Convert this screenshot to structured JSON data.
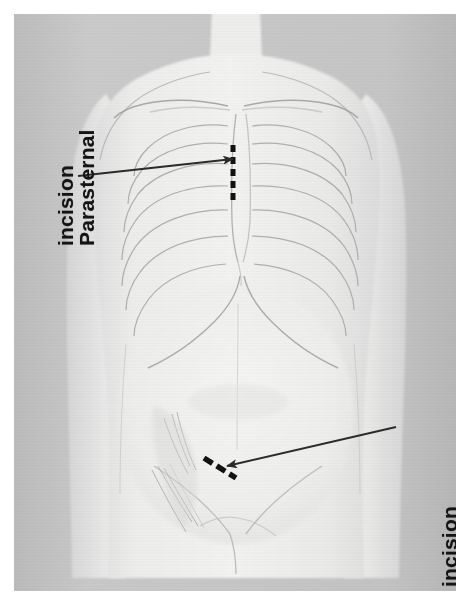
{
  "figure": {
    "kind": "anatomical-illustration",
    "view": "anterior torso",
    "background_color": "#c9c9c9",
    "body_color": "#ececeb",
    "line_color": "#9a9a9a",
    "marker_color": "#121212"
  },
  "labels": {
    "parasternal": {
      "line1": "Parasternal",
      "line2": "incision",
      "full": "Parasternal incision",
      "orientation": "rotated-90-ccw",
      "color": "#141414"
    },
    "femoral": {
      "line1": "Femoral vessel",
      "line2": "incision",
      "full": "Femoral vessel incision",
      "orientation": "rotated-90-ccw",
      "color": "#141414"
    }
  },
  "markers": {
    "parasternal_incision": {
      "name": "parasternal-incision-marker",
      "style": "vertical dashed line",
      "dashes": 5,
      "color": "#121212"
    },
    "femoral_incision": {
      "name": "femoral-incision-marker",
      "style": "oblique dashed line",
      "dashes": 3,
      "color": "#121212"
    }
  },
  "arrows": {
    "parasternal": {
      "name": "parasternal-arrow",
      "from": [
        78,
        176
      ],
      "to": [
        233,
        159
      ],
      "color": "#2b2b2b"
    },
    "femoral": {
      "name": "femoral-arrow",
      "from": [
        396,
        427
      ],
      "to": [
        227,
        466
      ],
      "color": "#2b2b2b"
    }
  },
  "anatomy_parts": [
    "neck",
    "left-shoulder",
    "right-shoulder",
    "left-clavicle",
    "right-clavicle",
    "sternum",
    "rib-cage",
    "costal-margin",
    "abdomen",
    "left-arm",
    "right-arm",
    "pelvis",
    "inguinal-region",
    "femoral-vessels"
  ]
}
